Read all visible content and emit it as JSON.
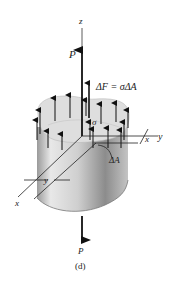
{
  "figure": {
    "caption": "(d)",
    "labels": {
      "z_axis": "z",
      "y_axis_top": "y",
      "x_axis_right": "x",
      "x_axis_left": "x",
      "y_dim": "y",
      "load_top": "P",
      "load_bottom": "P",
      "force_element": "ΔF = σΔA",
      "stress": "σ",
      "area_element": "ΔA"
    },
    "colors": {
      "arrows": "#111111",
      "body_light": "#e6e6e6",
      "body_dark": "#8a8a8a",
      "top_face": "#dcdcdc",
      "background": "#ffffff"
    }
  }
}
